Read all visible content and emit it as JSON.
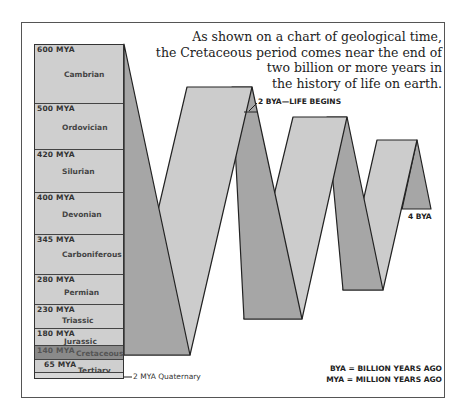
{
  "caption": {
    "lines": [
      "As shown on a chart of geological time,",
      "the Cretaceous period comes near the end of",
      "two billion or more years in",
      "the history of life on earth."
    ]
  },
  "timeline": {
    "eras": [
      {
        "mya": "600 MYA",
        "name": "Cambrian"
      },
      {
        "mya": "500 MYA",
        "name": "Ordovician"
      },
      {
        "mya": "420 MYA",
        "name": "Silurian"
      },
      {
        "mya": "400 MYA",
        "name": "Devonian"
      },
      {
        "mya": "345 MYA",
        "name": "Carboniferous"
      },
      {
        "mya": "280 MYA",
        "name": "Permian"
      },
      {
        "mya": "230 MYA",
        "name": "Triassic"
      },
      {
        "mya": "180 MYA",
        "name": "Jurassic"
      },
      {
        "mya": "140 MYA",
        "name": "Cretaceous",
        "highlighted": true
      },
      {
        "mya": "65 MYA",
        "name": "Tertiary"
      }
    ],
    "quaternary_label": "2 MYA Quaternary"
  },
  "ribbon": {
    "life_begins_label": "2 BYA—LIFE BEGINS",
    "end_label": "4 BYA"
  },
  "legend": {
    "bya": "BYA = BILLION YEARS AGO",
    "mya": "MYA = MILLION YEARS AGO"
  },
  "colors": {
    "light_face": "#cccccc",
    "dark_face": "#a6a6a6",
    "highlight_era": "#8a8a8a",
    "column": "#cfcfcf",
    "outline": "#222222"
  }
}
